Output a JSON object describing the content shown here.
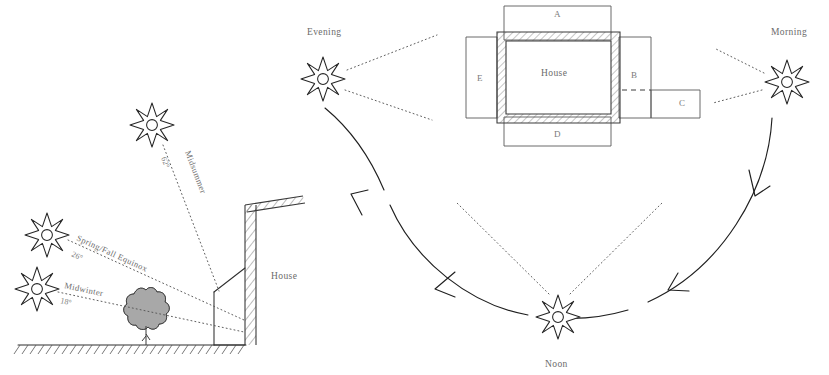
{
  "figure": {
    "background": "#ffffff",
    "ink_color": "#2f2f2f",
    "label_color": "#6b6b6b"
  },
  "section_diagram": {
    "name": "sun-angle-section",
    "house_label": "House",
    "sun_paths": [
      {
        "id": "midsummer",
        "label": "Midsummer",
        "angle": "62°"
      },
      {
        "id": "equinox",
        "label": "Spring/Fall Equinox",
        "angle": "26°"
      },
      {
        "id": "midwinter",
        "label": "Midwinter",
        "angle": "18°"
      }
    ],
    "elements": {
      "tree": "deciduous-tree",
      "ground": "hatched-ground-line",
      "wall": "hatched-house-wall"
    }
  },
  "plan_diagram": {
    "name": "sun-path-plan",
    "house_label": "House",
    "zones": [
      {
        "id": "A",
        "label": "A",
        "position": "north"
      },
      {
        "id": "B",
        "label": "B",
        "position": "east-upper"
      },
      {
        "id": "C",
        "label": "C",
        "position": "east-lower"
      },
      {
        "id": "D",
        "label": "D",
        "position": "south"
      },
      {
        "id": "E",
        "label": "E",
        "position": "west"
      }
    ],
    "sun_positions": [
      {
        "id": "morning",
        "label": "Morning"
      },
      {
        "id": "noon",
        "label": "Noon"
      },
      {
        "id": "evening",
        "label": "Evening"
      }
    ],
    "path_direction": "Morning → Noon → Evening"
  }
}
